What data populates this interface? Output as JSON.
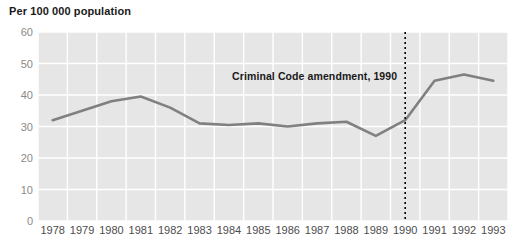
{
  "chart_data": {
    "type": "line",
    "title": "",
    "ylabel": "Per 100 000 population",
    "xlabel": "",
    "ylim": [
      0,
      60
    ],
    "yticks": [
      0,
      10,
      20,
      30,
      40,
      50,
      60
    ],
    "grid": true,
    "legend": "none",
    "categories": [
      "1978",
      "1979",
      "1980",
      "1981",
      "1982",
      "1983",
      "1984",
      "1985",
      "1986",
      "1987",
      "1988",
      "1989",
      "1990",
      "1991",
      "1992",
      "1993"
    ],
    "x": [
      1978,
      1979,
      1980,
      1981,
      1982,
      1983,
      1984,
      1985,
      1986,
      1987,
      1988,
      1989,
      1990,
      1991,
      1992,
      1993
    ],
    "values": [
      32,
      35,
      38,
      39.5,
      36,
      31,
      30.5,
      31,
      30,
      31,
      31.5,
      27,
      32,
      44.5,
      46.5,
      44.5
    ],
    "series": [
      {
        "name": "rate",
        "color": "#808080",
        "values": [
          32,
          35,
          38,
          39.5,
          36,
          31,
          30.5,
          31,
          30,
          31,
          31.5,
          27,
          32,
          44.5,
          46.5,
          44.5
        ]
      }
    ],
    "annotations": [
      {
        "text": "Criminal Code amendment, 1990",
        "type": "label",
        "x": 1990
      },
      {
        "text": "",
        "type": "vertical-dotted-line",
        "x": 1990,
        "color": "#000000"
      }
    ],
    "colors": {
      "plot_background": "#e6e6e6",
      "gridline": "#ffffff",
      "line": "#808080",
      "marker_line": "#000000",
      "ytick_text": "#8a8a8a",
      "xtick_text": "#4d4d4d",
      "title_text": "#1a1a1a"
    }
  },
  "axis": {
    "y_title": "Per 100 000 population",
    "y_ticks": [
      "60",
      "50",
      "40",
      "30",
      "20",
      "10",
      "0"
    ],
    "x_ticks": [
      "1978",
      "1979",
      "1980",
      "1981",
      "1982",
      "1983",
      "1984",
      "1985",
      "1986",
      "1987",
      "1988",
      "1989",
      "1990",
      "1991",
      "1992",
      "1993"
    ]
  },
  "annotation": {
    "amendment_label": "Criminal Code amendment, 1990"
  }
}
